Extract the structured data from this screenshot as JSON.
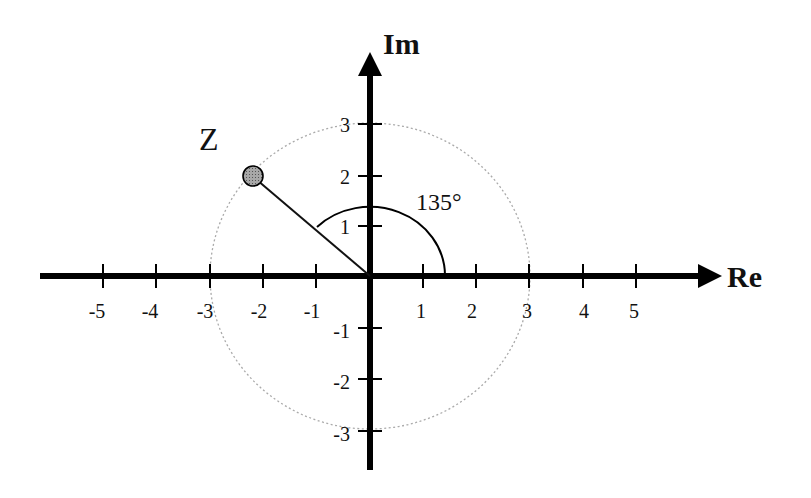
{
  "diagram": {
    "axes": {
      "x_label": "Re",
      "y_label": "Im",
      "x_ticks": [
        {
          "value": -5,
          "label": "-5"
        },
        {
          "value": -4,
          "label": "-4"
        },
        {
          "value": -3,
          "label": "-3"
        },
        {
          "value": -2,
          "label": "-2"
        },
        {
          "value": -1,
          "label": "-1"
        },
        {
          "value": 1,
          "label": "1"
        },
        {
          "value": 2,
          "label": "2"
        },
        {
          "value": 3,
          "label": "3"
        },
        {
          "value": 4,
          "label": "4"
        },
        {
          "value": 5,
          "label": "5"
        }
      ],
      "y_ticks": [
        {
          "value": 3,
          "label": "3"
        },
        {
          "value": 2,
          "label": "2"
        },
        {
          "value": 1,
          "label": "1"
        },
        {
          "value": -1,
          "label": "-1"
        },
        {
          "value": -2,
          "label": "-2"
        },
        {
          "value": -3,
          "label": "-3"
        }
      ]
    },
    "point": {
      "label": "Z",
      "modulus": 3,
      "angle_deg": 135,
      "fill_color": "#9a9a9a"
    },
    "angle_annotation": "135°",
    "circle": {
      "radius": 3,
      "style": "dotted",
      "color": "#aaaaaa"
    },
    "colors": {
      "axis": "#000000",
      "line": "#111111"
    }
  }
}
